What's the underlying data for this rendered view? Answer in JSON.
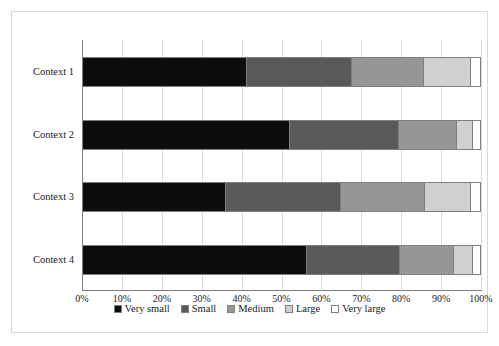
{
  "chart_data": {
    "type": "bar",
    "orientation": "horizontal",
    "stacked": true,
    "stack_mode": "percent",
    "title": "",
    "xlabel": "",
    "ylabel": "",
    "xlim": [
      0,
      100
    ],
    "grid": true,
    "legend_position": "bottom",
    "categories": [
      "Context 1",
      "Context 2",
      "Context 3",
      "Context 4"
    ],
    "xtick_labels": [
      "0%",
      "10%",
      "20%",
      "30%",
      "40%",
      "50%",
      "60%",
      "70%",
      "80%",
      "90%",
      "100%"
    ],
    "xtick_values": [
      0,
      10,
      20,
      30,
      40,
      50,
      60,
      70,
      80,
      90,
      100
    ],
    "series": [
      {
        "name": "Very small",
        "color": "#0d0d0d",
        "values": [
          41.4,
          52.1,
          36.1,
          56.4
        ]
      },
      {
        "name": "Small",
        "color": "#595959",
        "values": [
          26.3,
          27.3,
          28.8,
          23.3
        ]
      },
      {
        "name": "Medium",
        "color": "#969696",
        "values": [
          17.9,
          14.6,
          21.0,
          13.5
        ]
      },
      {
        "name": "Large",
        "color": "#d0d0d0",
        "values": [
          11.9,
          4.0,
          11.7,
          4.8
        ]
      },
      {
        "name": "Very large",
        "color": "#ffffff",
        "values": [
          2.5,
          2.0,
          2.4,
          2.0
        ]
      }
    ]
  },
  "style": {
    "frame_border": "#d9d9d9",
    "gridline": "#d9d9d9",
    "axis": "#808080",
    "segment_outline": "#7f7f7f",
    "text": "#1a1a1a",
    "background": "#ffffff"
  }
}
